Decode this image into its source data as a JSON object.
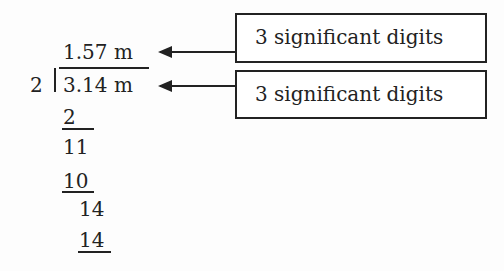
{
  "division": {
    "quotient": "1.57 m",
    "divisor": "2",
    "dividend": "3.14 m",
    "steps": [
      "2",
      "11",
      "10",
      "14",
      "14"
    ]
  },
  "annotations": [
    {
      "label": "3 significant digits",
      "points_to": "quotient"
    },
    {
      "label": "3 significant digits",
      "points_to": "dividend"
    }
  ]
}
